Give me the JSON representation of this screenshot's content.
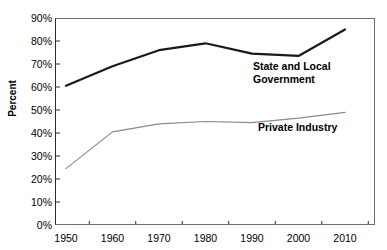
{
  "chart_data": {
    "type": "line",
    "title": "",
    "xlabel": "",
    "ylabel": "Percent",
    "x": [
      1950,
      1960,
      1970,
      1980,
      1990,
      2000,
      2010
    ],
    "categories": [
      "1950",
      "1960",
      "1970",
      "1980",
      "1990",
      "2000",
      "2010"
    ],
    "xtick_labels": [
      "1950",
      "1960",
      "1970",
      "1980",
      "1990",
      "2000",
      "2010"
    ],
    "ytick_labels": [
      "90%",
      "80%",
      "70%",
      "60%",
      "50%",
      "40%",
      "30%",
      "20%",
      "10%",
      "0%"
    ],
    "ylim": [
      0,
      90
    ],
    "ytick_values": [
      0,
      10,
      20,
      30,
      40,
      50,
      60,
      70,
      80,
      90
    ],
    "grid": false,
    "legend_position": "inline-annotation",
    "series": [
      {
        "name": "State and Local Government",
        "color": "#1a1a1a",
        "width": 2.2,
        "values": [
          60.5,
          69.0,
          76.0,
          79.0,
          74.5,
          73.5,
          85.0
        ]
      },
      {
        "name": "Private Industry",
        "color": "#8a8a8a",
        "width": 1.2,
        "values": [
          24.5,
          40.5,
          44.0,
          45.0,
          44.5,
          46.5,
          49.0
        ]
      }
    ],
    "annotations": [
      {
        "text": "State and Local\nGovernment",
        "series": "State and Local Government"
      },
      {
        "text": "Private Industry",
        "series": "Private Industry"
      }
    ]
  },
  "axis": {
    "frame_color": "#6f6f6f",
    "tick_color": "#2b2b2b"
  }
}
